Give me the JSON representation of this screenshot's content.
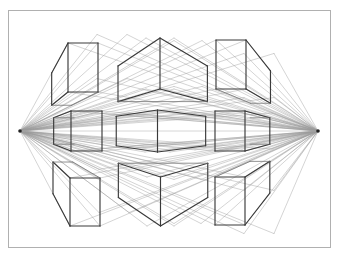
{
  "figure": {
    "type": "technical-perspective-drawing",
    "background_color": "#ffffff",
    "canvas": {
      "width": 339,
      "height": 262
    }
  },
  "frame": {
    "name": "drawing-border",
    "x": 8.5,
    "y": 10.5,
    "width": 322,
    "height": 237,
    "stroke": "#b0b0b0",
    "stroke_width": 1
  },
  "colors": {
    "cube_edge": "#3a3a3a",
    "cube_edge_light": "#6e6e6e",
    "construction_line": "#9a9a9a",
    "horizon_line": "#b5b5b5",
    "vanishing_point": "#222222",
    "frame": "#b0b0b0",
    "background": "#ffffff"
  },
  "line_widths": {
    "cube_edge": 1.15,
    "cube_edge_back": 0.75,
    "construction": 0.5,
    "horizon": 0.55,
    "frame": 1
  },
  "vanishing_points": [
    {
      "name": "vanishing-point-left",
      "label": "VPL",
      "x": 20,
      "y": 131
    },
    {
      "name": "vanishing-point-right",
      "label": "VPR",
      "x": 318,
      "y": 131
    }
  ],
  "horizon": {
    "name": "horizon-line",
    "y": 131,
    "x_start": 20,
    "x_end": 318
  },
  "cube_grid": {
    "rows": 3,
    "columns": 3,
    "row_labels": [
      "above-horizon",
      "at-horizon",
      "below-horizon"
    ],
    "column_labels": [
      "left",
      "center",
      "right"
    ]
  },
  "cubes": [
    {
      "id": "cube-top-left",
      "row": 0,
      "col": 0,
      "view": "from-below",
      "front_face": {
        "x": 68,
        "y": 43,
        "width": 30,
        "height": 49
      },
      "depth_dx": 29,
      "depth_dy": -11
    },
    {
      "id": "cube-top-center",
      "row": 0,
      "col": 1,
      "view": "from-below-center",
      "front_face": {
        "x": 146,
        "y": 38,
        "width": 28,
        "height": 51
      },
      "depth_dx": 28,
      "depth_dy": 0
    },
    {
      "id": "cube-top-right",
      "row": 0,
      "col": 2,
      "view": "from-below",
      "front_face": {
        "x": 216,
        "y": 40,
        "width": 30,
        "height": 49
      },
      "depth_dx": 28,
      "depth_dy": 11
    },
    {
      "id": "cube-mid-left",
      "row": 1,
      "col": 0,
      "view": "eye-level",
      "front_face": {
        "x": 71,
        "y": 111,
        "width": 31,
        "height": 40
      },
      "depth_dx": 27,
      "depth_dy": 0
    },
    {
      "id": "cube-mid-center",
      "row": 1,
      "col": 1,
      "view": "eye-level-center",
      "front_face": {
        "x": 145,
        "y": 110,
        "width": 25,
        "height": 42
      },
      "depth_dx": 25,
      "depth_dy": 0
    },
    {
      "id": "cube-mid-right",
      "row": 1,
      "col": 2,
      "view": "eye-level",
      "front_face": {
        "x": 215,
        "y": 111,
        "width": 30,
        "height": 40
      },
      "depth_dx": 27,
      "depth_dy": 0
    },
    {
      "id": "cube-bottom-left",
      "row": 2,
      "col": 0,
      "view": "from-above",
      "front_face": {
        "x": 70,
        "y": 178,
        "width": 30,
        "height": 48
      },
      "depth_dx": 29,
      "depth_dy": -11
    },
    {
      "id": "cube-bottom-center",
      "row": 2,
      "col": 1,
      "view": "from-above-center",
      "front_face": {
        "x": 147,
        "y": 177,
        "width": 27,
        "height": 49
      },
      "depth_dx": 27,
      "depth_dy": 0
    },
    {
      "id": "cube-bottom-right",
      "row": 2,
      "col": 2,
      "view": "from-above",
      "front_face": {
        "x": 215,
        "y": 177,
        "width": 30,
        "height": 48
      },
      "depth_dx": 29,
      "depth_dy": 11
    }
  ],
  "construction_rays": {
    "description": "Each cube corner is joined by guide lines back to the left and right vanishing points.",
    "left_targets_y": [
      43,
      52,
      82,
      92,
      111,
      121,
      131,
      141,
      151,
      170,
      178,
      189,
      215,
      226
    ],
    "right_targets_y": [
      40,
      51,
      79,
      89,
      111,
      121,
      131,
      141,
      151,
      170,
      177,
      188,
      214,
      226
    ]
  }
}
